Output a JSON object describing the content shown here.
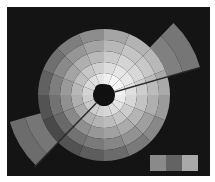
{
  "figure": {
    "center": [
      104,
      95
    ],
    "hole_radius": 11,
    "ring_radii": [
      11,
      22,
      33,
      44,
      55,
      66
    ],
    "sector_count": 16,
    "start_angle_deg": 0,
    "ring_base_gray": [
      235,
      215,
      195,
      175,
      155
    ],
    "sector_gray_offset": [
      0,
      -8,
      -14,
      -20,
      -26,
      -30,
      -34,
      -30,
      -24,
      -18,
      -12,
      -6,
      4,
      10,
      12,
      6
    ],
    "extended_wedges": [
      {
        "name": "top-right",
        "start_deg": -46,
        "end_deg": -16,
        "outer_radius": 100,
        "rings": [
          [
            66,
            82,
            128
          ],
          [
            82,
            100,
            118
          ]
        ]
      },
      {
        "name": "bottom-left",
        "start_deg": 134,
        "end_deg": 164,
        "outer_radius": 98,
        "rings": [
          [
            66,
            82,
            118
          ],
          [
            82,
            98,
            108
          ]
        ]
      }
    ],
    "split_lines": [
      {
        "angle_deg": -16,
        "color": "#2a2a2a"
      },
      {
        "angle_deg": 134,
        "color": "#2a2a2a"
      }
    ],
    "center_blob_color": "#101010"
  },
  "legend": {
    "swatches": [
      {
        "color": "#8a8a8a"
      },
      {
        "color": "#636363"
      },
      {
        "color": "#a9a9a9"
      }
    ]
  }
}
